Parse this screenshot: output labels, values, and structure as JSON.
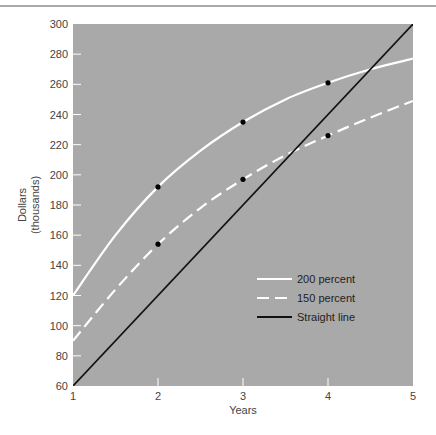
{
  "chart_data": {
    "type": "line",
    "title": "",
    "xlabel": "Years",
    "ylabel": "Dollars\n(thousands)",
    "ylabel_lines": [
      "Dollars",
      "(thousands)"
    ],
    "xlim": [
      1,
      5
    ],
    "ylim": [
      60,
      300
    ],
    "x_ticks": [
      1,
      2,
      3,
      4,
      5
    ],
    "y_ticks": [
      60,
      80,
      100,
      120,
      140,
      160,
      180,
      200,
      220,
      240,
      260,
      280,
      300
    ],
    "grid": false,
    "plot_background": "#a9a9a9",
    "legend_position": "lower right (inside plot)",
    "series": [
      {
        "name": "200 percent",
        "style": "solid",
        "color": "#ffffff",
        "x": [
          1,
          1.5,
          2,
          2.5,
          3,
          3.5,
          4,
          4.5,
          5
        ],
        "values": [
          120,
          160,
          192,
          216,
          235,
          250,
          261,
          270,
          277
        ],
        "markers": [
          {
            "x": 2,
            "y": 192
          },
          {
            "x": 3,
            "y": 235
          },
          {
            "x": 4,
            "y": 261
          }
        ]
      },
      {
        "name": "150 percent",
        "style": "dashed",
        "color": "#ffffff",
        "x": [
          1,
          1.5,
          2,
          2.5,
          3,
          3.5,
          4,
          4.5,
          5
        ],
        "values": [
          90,
          124,
          154,
          178,
          197,
          213,
          226,
          238,
          249
        ],
        "markers": [
          {
            "x": 2,
            "y": 154
          },
          {
            "x": 3,
            "y": 197
          },
          {
            "x": 4,
            "y": 226
          }
        ]
      },
      {
        "name": "Straight line",
        "style": "solid",
        "color": "#111111",
        "x": [
          1,
          5
        ],
        "values": [
          60,
          300
        ],
        "markers": []
      }
    ]
  },
  "legend": {
    "items": [
      {
        "label": "200 percent"
      },
      {
        "label": "150 percent"
      },
      {
        "label": "Straight line"
      }
    ]
  }
}
